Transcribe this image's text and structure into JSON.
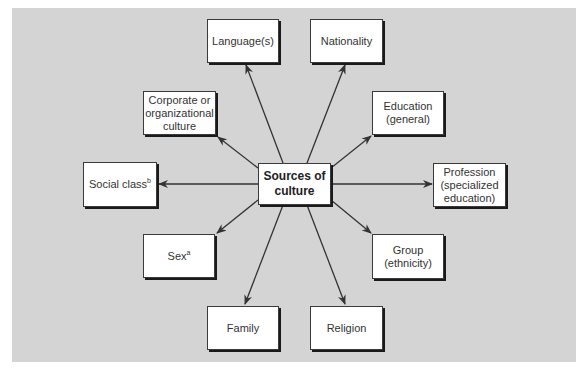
{
  "diagram": {
    "title": "",
    "colors": {
      "background": "#d4d4d4",
      "box_fill": "#ffffff",
      "box_border": "#3a3a3a",
      "arrow": "#333333"
    },
    "center": {
      "label": "Sources of\nculture"
    },
    "nodes": [
      {
        "id": "language",
        "label": "Language(s)",
        "superscript": ""
      },
      {
        "id": "nationality",
        "label": "Nationality",
        "superscript": ""
      },
      {
        "id": "corporate",
        "label": "Corporate or\norganizational\nculture",
        "superscript": ""
      },
      {
        "id": "education",
        "label": "Education\n(general)",
        "superscript": ""
      },
      {
        "id": "social-class",
        "label": "Social class",
        "superscript": "b"
      },
      {
        "id": "profession",
        "label": "Profession\n(specialized\neducation)",
        "superscript": ""
      },
      {
        "id": "sex",
        "label": "Sex",
        "superscript": "a"
      },
      {
        "id": "group",
        "label": "Group\n(ethnicity)",
        "superscript": ""
      },
      {
        "id": "family",
        "label": "Family",
        "superscript": ""
      },
      {
        "id": "religion",
        "label": "Religion",
        "superscript": ""
      }
    ],
    "edges": [
      {
        "from": "center",
        "to": "language"
      },
      {
        "from": "center",
        "to": "nationality"
      },
      {
        "from": "center",
        "to": "corporate"
      },
      {
        "from": "center",
        "to": "education"
      },
      {
        "from": "center",
        "to": "social-class"
      },
      {
        "from": "center",
        "to": "profession"
      },
      {
        "from": "center",
        "to": "sex"
      },
      {
        "from": "center",
        "to": "group"
      },
      {
        "from": "center",
        "to": "family"
      },
      {
        "from": "center",
        "to": "religion"
      }
    ]
  }
}
